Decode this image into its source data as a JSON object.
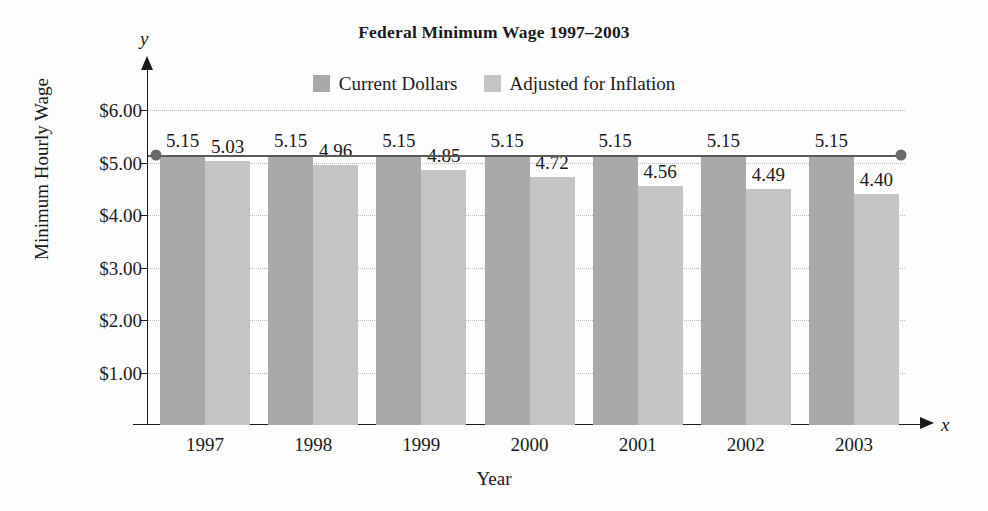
{
  "chart_data": {
    "type": "bar",
    "title": "Federal Minimum Wage 1997–2003",
    "xlabel": "Year",
    "ylabel": "Minimum Hourly Wage",
    "x_axis_letter": "x",
    "y_axis_letter": "y",
    "categories": [
      "1997",
      "1998",
      "1999",
      "2000",
      "2001",
      "2002",
      "2003"
    ],
    "series": [
      {
        "name": "Current Dollars",
        "color": "#a9a9a9",
        "values": [
          5.15,
          5.15,
          5.15,
          5.15,
          5.15,
          5.15,
          5.15
        ],
        "labels": [
          "5.15",
          "5.15",
          "5.15",
          "5.15",
          "5.15",
          "5.15",
          "5.15"
        ]
      },
      {
        "name": "Adjusted for Inflation",
        "color": "#c4c4c4",
        "values": [
          5.03,
          4.96,
          4.85,
          4.72,
          4.56,
          4.49,
          4.4
        ],
        "labels": [
          "5.03",
          "4.96",
          "4.85",
          "4.72",
          "4.56",
          "4.49",
          "4.40"
        ]
      }
    ],
    "ylim": [
      0,
      6.0
    ],
    "y_ticks": [
      1.0,
      2.0,
      3.0,
      4.0,
      5.0,
      6.0
    ],
    "y_tick_labels": [
      "$1.00",
      "$2.00",
      "$3.00",
      "$4.00",
      "$5.00",
      "$6.00"
    ],
    "grid": "horizontal-dotted",
    "legend_position": "top-center",
    "annotation_line": {
      "label": "5.15 constant level line",
      "value": 5.15,
      "endpoint_markers": true
    }
  },
  "legend": {
    "entries": [
      {
        "label": "Current Dollars",
        "swatch": "legend-swatch-current-dollars"
      },
      {
        "label": "Adjusted for Inflation",
        "swatch": "legend-swatch-adjusted-inflation"
      }
    ]
  },
  "colors": {
    "current_dollars": "#a9a9a9",
    "adjusted_for_inflation": "#c4c4c4",
    "axis": "#1a1a1a",
    "gridline": "#b9b9b9",
    "trend_line": "#5a5a5a",
    "background": "#fdfdfd"
  }
}
